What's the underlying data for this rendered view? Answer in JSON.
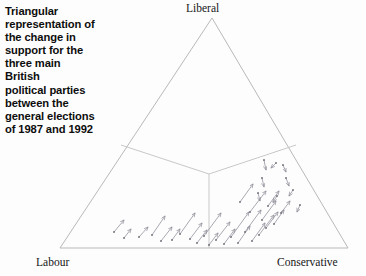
{
  "caption": {
    "text": "Triangular\nrepresentation of\nthe change in\nsupport for the\nthree main\nBritish\npolitical parties\nbetween the\ngeneral elections\nof 1987 and 1992"
  },
  "colors": {
    "triangle_stroke": "#b9b9b9",
    "divider_stroke": "#c2c2c2",
    "arrow_stroke": "#8c8c98",
    "dot_fill": "#6e6e78",
    "background": "#fdfdfd",
    "text": "#141414"
  },
  "chart_data": {
    "type": "scatter",
    "title": "Triangular representation of the change in support for the three main British political parties between the general elections of 1987 and 1992",
    "subtitle": "",
    "xlabel": "",
    "ylabel": "",
    "grid": false,
    "legend_position": "none",
    "vertices": [
      {
        "name": "liberal",
        "label": "Liberal",
        "x": 212,
        "y": 18
      },
      {
        "name": "labour",
        "label": "Labour",
        "x": 60,
        "y": 248
      },
      {
        "name": "conservative",
        "label": "Conservative",
        "x": 348,
        "y": 248
      }
    ],
    "centroid": {
      "x": 209,
      "y": 174
    },
    "dividers": [
      {
        "name": "divider-to-left-edge",
        "x1": 209,
        "y1": 174,
        "x2": 121,
        "y2": 145
      },
      {
        "name": "divider-to-right-edge",
        "x1": 209,
        "y1": 174,
        "x2": 296,
        "y2": 145
      },
      {
        "name": "divider-to-base",
        "x1": 209,
        "y1": 174,
        "x2": 209,
        "y2": 248
      }
    ],
    "vectors": [
      {
        "x": 114,
        "y": 232,
        "dx": 10,
        "dy": -12
      },
      {
        "x": 124,
        "y": 238,
        "dx": 7,
        "dy": -9
      },
      {
        "x": 139,
        "y": 237,
        "dx": 9,
        "dy": -10
      },
      {
        "x": 152,
        "y": 235,
        "dx": 13,
        "dy": -19
      },
      {
        "x": 161,
        "y": 241,
        "dx": 11,
        "dy": -14
      },
      {
        "x": 172,
        "y": 240,
        "dx": 8,
        "dy": -11
      },
      {
        "x": 180,
        "y": 234,
        "dx": 15,
        "dy": -21
      },
      {
        "x": 190,
        "y": 239,
        "dx": 12,
        "dy": -16
      },
      {
        "x": 197,
        "y": 243,
        "dx": 10,
        "dy": -13
      },
      {
        "x": 204,
        "y": 236,
        "dx": 17,
        "dy": -23
      },
      {
        "x": 209,
        "y": 245,
        "dx": 9,
        "dy": -12
      },
      {
        "x": 216,
        "y": 240,
        "dx": 14,
        "dy": -18
      },
      {
        "x": 224,
        "y": 244,
        "dx": 11,
        "dy": -15
      },
      {
        "x": 231,
        "y": 237,
        "dx": 18,
        "dy": -25
      },
      {
        "x": 238,
        "y": 243,
        "dx": 12,
        "dy": -17
      },
      {
        "x": 245,
        "y": 232,
        "dx": 16,
        "dy": -22
      },
      {
        "x": 252,
        "y": 241,
        "dx": 13,
        "dy": -18
      },
      {
        "x": 259,
        "y": 235,
        "dx": 15,
        "dy": -20
      },
      {
        "x": 266,
        "y": 228,
        "dx": 12,
        "dy": -16
      },
      {
        "x": 262,
        "y": 220,
        "dx": 14,
        "dy": -19
      },
      {
        "x": 274,
        "y": 224,
        "dx": 10,
        "dy": -14
      },
      {
        "x": 250,
        "y": 212,
        "dx": 16,
        "dy": -21
      },
      {
        "x": 268,
        "y": 206,
        "dx": 11,
        "dy": -15
      },
      {
        "x": 240,
        "y": 202,
        "dx": 13,
        "dy": -18
      },
      {
        "x": 281,
        "y": 213,
        "dx": 9,
        "dy": -12
      },
      {
        "x": 264,
        "y": 160,
        "dx": 2,
        "dy": 10
      },
      {
        "x": 276,
        "y": 163,
        "dx": -5,
        "dy": 5
      },
      {
        "x": 262,
        "y": 178,
        "dx": 2,
        "dy": 9
      },
      {
        "x": 258,
        "y": 193,
        "dx": 2,
        "dy": 8
      },
      {
        "x": 277,
        "y": 196,
        "dx": -4,
        "dy": 6
      },
      {
        "x": 286,
        "y": 178,
        "dx": 3,
        "dy": 8
      },
      {
        "x": 293,
        "y": 190,
        "dx": -4,
        "dy": 6
      },
      {
        "x": 283,
        "y": 165,
        "dx": 3,
        "dy": 7
      },
      {
        "x": 300,
        "y": 205,
        "dx": -3,
        "dy": 7
      }
    ]
  }
}
